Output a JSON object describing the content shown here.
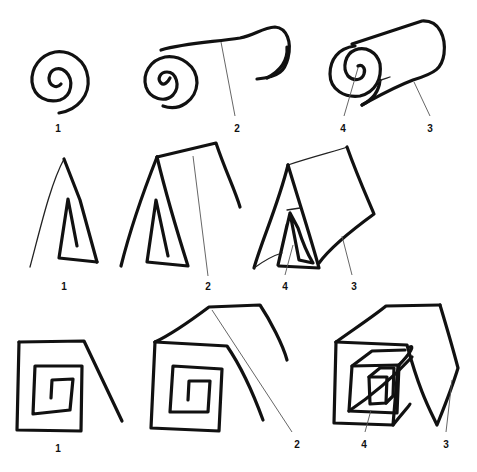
{
  "figure": {
    "rows": [
      {
        "name": "spiral-to-roll",
        "labels": [
          {
            "id": "r1-1",
            "text": "1",
            "x": 58,
            "y": 124
          },
          {
            "id": "r1-2",
            "text": "2",
            "x": 237,
            "y": 124
          },
          {
            "id": "r1-4",
            "text": "4",
            "x": 343,
            "y": 124
          },
          {
            "id": "r1-3",
            "text": "3",
            "x": 430,
            "y": 124
          }
        ]
      },
      {
        "name": "triangle-to-prism",
        "labels": [
          {
            "id": "r2-1",
            "text": "1",
            "x": 64,
            "y": 282
          },
          {
            "id": "r2-2",
            "text": "2",
            "x": 208,
            "y": 282
          },
          {
            "id": "r2-4",
            "text": "4",
            "x": 285,
            "y": 282
          },
          {
            "id": "r2-3",
            "text": "3",
            "x": 354,
            "y": 282
          }
        ]
      },
      {
        "name": "square-to-box",
        "labels": [
          {
            "id": "r3-1",
            "text": "1",
            "x": 58,
            "y": 444
          },
          {
            "id": "r3-2",
            "text": "2",
            "x": 297,
            "y": 440
          },
          {
            "id": "r3-4",
            "text": "4",
            "x": 364,
            "y": 440
          },
          {
            "id": "r3-3",
            "text": "3",
            "x": 446,
            "y": 440
          }
        ]
      }
    ],
    "colors": {
      "ink": "#111111",
      "leader": "#555555",
      "background": "#ffffff"
    }
  }
}
